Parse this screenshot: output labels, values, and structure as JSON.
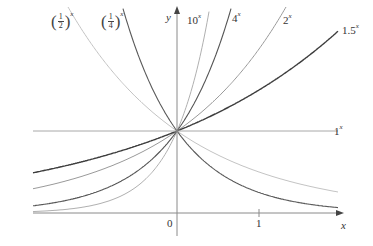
{
  "chart_data": {
    "type": "line",
    "title": "",
    "xlabel": "x",
    "ylabel": "y",
    "xlim": [
      -1.76,
      1.95
    ],
    "ylim": [
      -0.4,
      2.5
    ],
    "grid": false,
    "legend_position": "inline labels at curve ends",
    "x_ticks": [
      {
        "value": 0,
        "label": "0"
      },
      {
        "value": 1,
        "label": "1"
      }
    ],
    "annotations": [
      "All curves pass through (0, 1)"
    ],
    "series": [
      {
        "name": "(1/2)^x",
        "base": 0.5,
        "label_main": "1",
        "label_den": "2",
        "color": "#c4c4c4",
        "width": 1.0
      },
      {
        "name": "(1/4)^x",
        "base": 0.25,
        "label_main": "1",
        "label_den": "4",
        "color": "#5a5a5a",
        "width": 1.1
      },
      {
        "name": "10^x",
        "base": 10,
        "label_main": "10",
        "color": "#b0b0b0",
        "width": 1.0
      },
      {
        "name": "4^x",
        "base": 4,
        "label_main": "4",
        "color": "#555555",
        "width": 1.1
      },
      {
        "name": "2^x",
        "base": 2,
        "label_main": "2",
        "color": "#9a9a9a",
        "width": 1.0
      },
      {
        "name": "1.5^x",
        "base": 1.5,
        "label_main": "1.5",
        "color": "#3e3e3e",
        "width": 1.4
      },
      {
        "name": "1^x",
        "base": 1,
        "label_main": "1",
        "color": "#a8a8a8",
        "width": 1.0
      }
    ],
    "labels": {
      "half": {
        "num": "1",
        "den": "2",
        "exp": "x"
      },
      "quarter": {
        "num": "1",
        "den": "4",
        "exp": "x"
      },
      "ten": {
        "base": "10",
        "exp": "x"
      },
      "four": {
        "base": "4",
        "exp": "x"
      },
      "two": {
        "base": "2",
        "exp": "x"
      },
      "onefive": {
        "base": "1.5",
        "exp": "x"
      },
      "one": {
        "base": "1",
        "exp": "x"
      },
      "y_axis": "y",
      "x_axis": "x",
      "origin": "0",
      "tick_one": "1"
    }
  }
}
